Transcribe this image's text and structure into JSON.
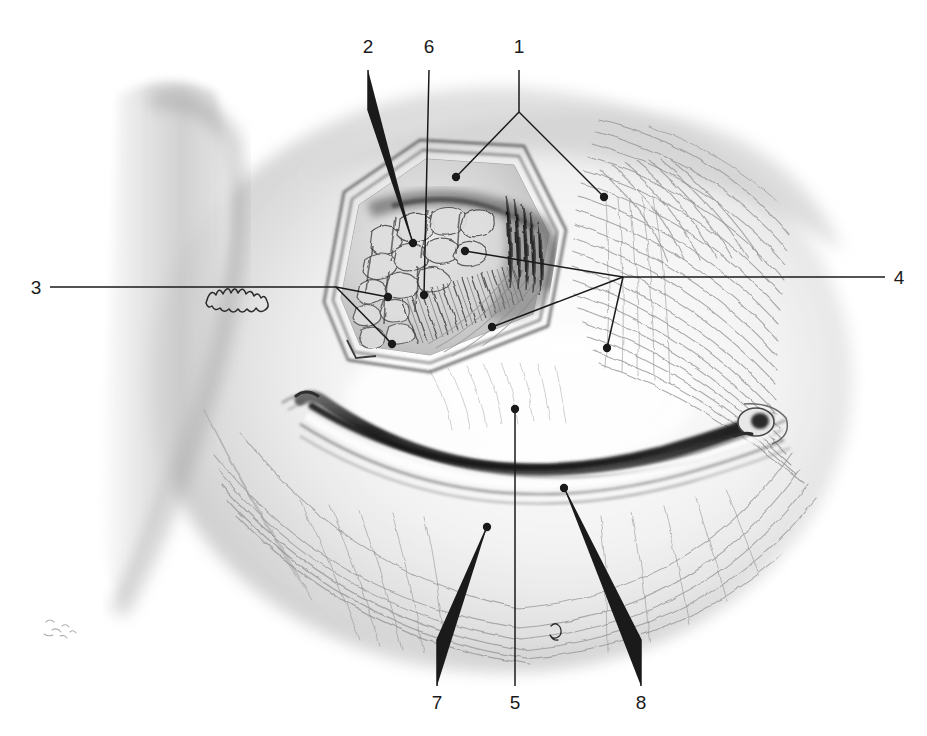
{
  "figure": {
    "kind": "anatomical-pencil-illustration",
    "medium": "graphite pencil drawing, grayscale",
    "background_color": "#ffffff",
    "ink_color": "#1a1a1a",
    "drawing_bounds": {
      "left": 95,
      "top": 85,
      "right": 850,
      "bottom": 665
    }
  },
  "labels": [
    {
      "id": "1",
      "text": "1",
      "x": 519,
      "y": 58,
      "anchor": "middle"
    },
    {
      "id": "2",
      "text": "2",
      "x": 368,
      "y": 58,
      "anchor": "middle"
    },
    {
      "id": "3",
      "text": "3",
      "x": 36,
      "y": 287,
      "anchor": "middle"
    },
    {
      "id": "4",
      "text": "4",
      "x": 899,
      "y": 277,
      "anchor": "middle"
    },
    {
      "id": "5",
      "text": "5",
      "x": 515,
      "y": 698,
      "anchor": "middle"
    },
    {
      "id": "6",
      "text": "6",
      "x": 429,
      "y": 58,
      "anchor": "middle"
    },
    {
      "id": "7",
      "text": "7",
      "x": 437,
      "y": 698,
      "anchor": "middle"
    },
    {
      "id": "8",
      "text": "8",
      "x": 641,
      "y": 698,
      "anchor": "middle"
    }
  ],
  "leaders": [
    {
      "id": "leader-1",
      "label": "1",
      "branch": true,
      "polyline": "519,70 519,112",
      "branches": [
        "519,112 456,177",
        "519,112 604,197"
      ],
      "dots": [
        [
          456,
          177
        ],
        [
          604,
          197
        ]
      ]
    },
    {
      "id": "leader-2",
      "label": "2",
      "branch": false,
      "polyline": "368,70 368,110 413,243",
      "dots": [
        [
          413,
          243
        ]
      ]
    },
    {
      "id": "leader-3",
      "label": "3",
      "branch": true,
      "polyline": "50,287 336,287",
      "branches": [
        "336,287 388,297",
        "336,287 392,344"
      ],
      "dots": [
        [
          388,
          297
        ],
        [
          392,
          344
        ]
      ]
    },
    {
      "id": "leader-4",
      "label": "4",
      "branch": true,
      "polyline": "885,277 623,277",
      "branches": [
        "623,277 465,251",
        "623,277 492,327",
        "623,277 607,348"
      ],
      "dots": [
        [
          465,
          251
        ],
        [
          492,
          327
        ],
        [
          607,
          348
        ]
      ]
    },
    {
      "id": "leader-5",
      "label": "5",
      "branch": false,
      "polyline": "515,686 515,409",
      "dots": [
        [
          515,
          409
        ]
      ]
    },
    {
      "id": "leader-6",
      "label": "6",
      "branch": false,
      "polyline": "429,70 424,295",
      "dots": [
        [
          424,
          295
        ]
      ]
    },
    {
      "id": "leader-7",
      "label": "7",
      "branch": false,
      "polyline": "437,686 437,640 487,527",
      "dots": [
        [
          487,
          527
        ]
      ]
    },
    {
      "id": "leader-8",
      "label": "8",
      "branch": false,
      "polyline": "641,686 641,640 564,488",
      "dots": [
        [
          564,
          488
        ]
      ]
    }
  ],
  "regions": [
    {
      "name": "nasal-bridge-shading",
      "description": "soft vertical graphite band along the left edge forming the bridge of the nose"
    },
    {
      "name": "orbicularis-striations",
      "description": "concentric sweeping fiber strokes filling the orbital region right and below the window"
    },
    {
      "name": "dissection-window",
      "description": "hexagonal flap outline opened in the upper eyelid exposing deeper tissue"
    },
    {
      "name": "gland-lobules",
      "description": "irregular cobbled lobules of the lacrimal gland inside the window"
    },
    {
      "name": "tarsal-plate-fibers",
      "description": "dense parallel short strokes forming the tarsal plate inside the window"
    },
    {
      "name": "lower-lid-margin",
      "description": "long dark crescent marking the lash line of the lower lid"
    },
    {
      "name": "lateral-canthus",
      "description": "rounded knob at the right end of the lid margin"
    },
    {
      "name": "skin-crease-squiggle",
      "description": "small jagged squiggle marking a skin fold at left of the window"
    }
  ]
}
